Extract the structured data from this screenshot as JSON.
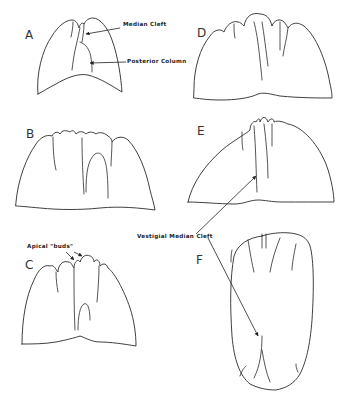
{
  "figure": {
    "panels": [
      {
        "letter": "A",
        "description": "Early lung lobe outline with median cleft and posterior column"
      },
      {
        "letter": "B",
        "description": "Lobe with multiple apical clefts"
      },
      {
        "letter": "C",
        "description": "Lobe showing apical buds"
      },
      {
        "letter": "D",
        "description": "Lobe with multiple apical lobules"
      },
      {
        "letter": "E",
        "description": "Lobe with vestigial median cleft"
      },
      {
        "letter": "F",
        "description": "Elongated oval lobe with vestigial median cleft"
      }
    ],
    "labels": {
      "median_cleft": "Median Cleft",
      "posterior_column": "Posterior Column",
      "apical_buds": "Apical  \"buds\"",
      "vestigial_median_cleft": "Vestigial  Median  Cleft"
    },
    "colors": {
      "background": "#ffffff",
      "line": "#2a2a2a"
    }
  }
}
